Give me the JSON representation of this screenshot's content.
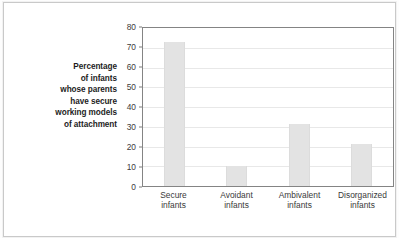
{
  "chart_data": {
    "type": "bar",
    "title": "",
    "subtitle": "",
    "xlabel": "",
    "ylabel": "Percentage of infants whose parents have secure working models of attachment",
    "ylabel_lines": [
      "Percentage",
      "of infants",
      "whose parents",
      "have secure",
      "working models",
      "of attachment"
    ],
    "categories": [
      "Secure infants",
      "Avoidant infants",
      "Ambivalent infants",
      "Disorganized infants"
    ],
    "category_lines": [
      [
        "Secure",
        "infants"
      ],
      [
        "Avoidant",
        "infants"
      ],
      [
        "Ambivalent",
        "infants"
      ],
      [
        "Disorganized",
        "infants"
      ]
    ],
    "values": [
      73,
      10,
      31.5,
      21.5
    ],
    "ylim": [
      0,
      80
    ],
    "ytick_values": [
      0,
      10,
      20,
      30,
      40,
      50,
      60,
      70,
      80
    ],
    "ytick_labels": [
      "0",
      "10",
      "20",
      "30",
      "40",
      "50",
      "60",
      "70",
      "80"
    ],
    "grid": true,
    "legend": null,
    "colors": {
      "bar_fill": "#e3e3e3",
      "plot_border": "#848484",
      "gridline": "#e8e8e8",
      "tick_text": "#3c3c3c",
      "axis_label_text": "#1d1d1d",
      "frame_border": "#c9c9c9",
      "background": "#ffffff"
    }
  }
}
